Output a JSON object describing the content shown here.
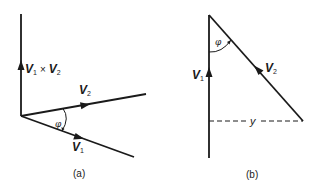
{
  "figure": {
    "panel_a": {
      "caption": "(a)",
      "vectors": [
        {
          "name": "V1xV2",
          "label_main": "V",
          "label_sub": "1",
          "label_op": "×",
          "label_main2": "V",
          "label_sub2": "2"
        },
        {
          "name": "V2",
          "label_main": "V",
          "label_sub": "2"
        },
        {
          "name": "V1",
          "label_main": "V",
          "label_sub": "1"
        }
      ],
      "angle_label": "φ"
    },
    "panel_b": {
      "caption": "(b)",
      "vectors": [
        {
          "name": "V1",
          "label_main": "V",
          "label_sub": "1"
        },
        {
          "name": "V2",
          "label_main": "V",
          "label_sub": "2"
        }
      ],
      "angle_label": "φ",
      "distance_label": "y"
    },
    "colors": {
      "ink": "#1a1a1a",
      "background": "#ffffff"
    }
  }
}
